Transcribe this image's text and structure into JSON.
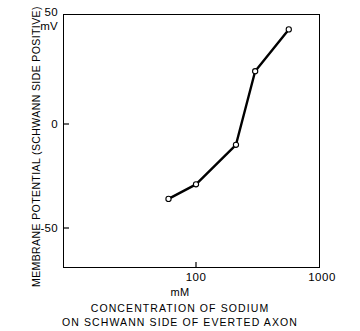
{
  "chart_data": {
    "type": "line",
    "title": "",
    "xlabel": "CONCENTRATION OF SODIUM ON SCHWANN SIDE OF EVERTED AXON",
    "xunit": "mM",
    "ylabel": "MEMBRANE POTENTIAL (SCHWANN SIDE POSITIVE)",
    "yunit": "mV",
    "xscale": "log",
    "yscale": "linear",
    "xlim": [
      40,
      1000
    ],
    "ylim": [
      -68,
      50
    ],
    "grid": false,
    "legend": null,
    "marker": "open-circle",
    "x": [
      60,
      100,
      210,
      300,
      560
    ],
    "y": [
      -36,
      -29,
      -10,
      24,
      43
    ],
    "points": [
      {
        "x": 60,
        "y": -36
      },
      {
        "x": 100,
        "y": -29
      },
      {
        "x": 210,
        "y": -10
      },
      {
        "x": 300,
        "y": 24
      },
      {
        "x": 560,
        "y": 43
      }
    ],
    "xticks": [
      100,
      1000
    ],
    "xtick_labels": [
      "100",
      "1000"
    ],
    "yticks": [
      50,
      0,
      -50
    ],
    "ytick_labels": [
      "50",
      "0",
      "-50"
    ],
    "line_color": "#000000",
    "marker_face_color": "#ffffff",
    "marker_edge_color": "#000000",
    "axis_color": "#000000"
  },
  "axes": {
    "y_title": "MEMBRANE POTENTIAL (SCHWANN SIDE POSITIVE)",
    "y_unit": "mV",
    "y_tick_top": "50",
    "y_tick_mid": "0",
    "y_tick_bottom": "-50",
    "x_tick_left": "100",
    "x_tick_right": "1000",
    "x_unit": "mM"
  },
  "caption": {
    "line1": "CONCENTRATION OF SODIUM",
    "line2": "ON SCHWANN SIDE OF EVERTED AXON"
  }
}
